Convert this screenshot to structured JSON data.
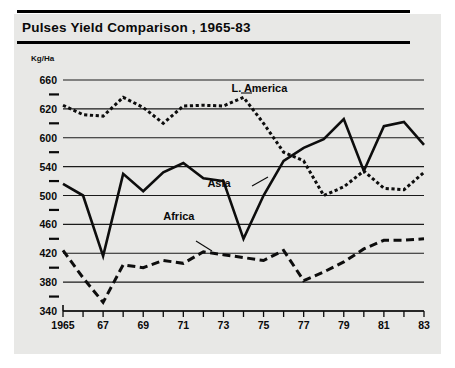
{
  "figure": {
    "title": "Pulses Yield Comparison , 1965-83",
    "unit_label": "Kg/Ha",
    "background_color": "#e8e8e6",
    "ink_color": "#0d0d0d"
  },
  "chart_data": {
    "type": "line",
    "title": "Pulses Yield Comparison , 1965-83",
    "xlabel": "",
    "ylabel": "Kg/Ha",
    "xlim": [
      1965,
      1983
    ],
    "ylim": [
      340,
      660
    ],
    "grid": true,
    "legend_position": "inline-annotations",
    "x": [
      1965,
      1966,
      1967,
      1968,
      1969,
      1970,
      1971,
      1972,
      1973,
      1974,
      1975,
      1976,
      1977,
      1978,
      1979,
      1980,
      1981,
      1982,
      1983
    ],
    "ytick_labels": [
      "660",
      "620",
      "600",
      "540",
      "500",
      "460",
      "420",
      "380",
      "340"
    ],
    "ytick_values": [
      660,
      620,
      580,
      540,
      500,
      460,
      420,
      380,
      340
    ],
    "minor_ytick_values": [
      640,
      600,
      560,
      520,
      480,
      440,
      400,
      360
    ],
    "xtick_labels": [
      "1965",
      "67",
      "69",
      "71",
      "73",
      "75",
      "77",
      "79",
      "81",
      "83"
    ],
    "xtick_values": [
      1965,
      1967,
      1969,
      1971,
      1973,
      1975,
      1977,
      1979,
      1981,
      1983
    ],
    "series": [
      {
        "name": "L. America",
        "style": "dotted",
        "label_x": 1973.4,
        "label_y": 643,
        "values": [
          625,
          612,
          610,
          636,
          622,
          600,
          624,
          625,
          624,
          636,
          600,
          560,
          548,
          500,
          512,
          534,
          510,
          508,
          532
        ]
      },
      {
        "name": "Asia",
        "style": "solid",
        "label_x": 1972.2,
        "label_y": 512,
        "values": [
          516,
          500,
          416,
          530,
          506,
          532,
          545,
          524,
          520,
          440,
          500,
          548,
          566,
          578,
          606,
          534,
          596,
          602,
          570
        ]
      },
      {
        "name": "Africa",
        "style": "dashed",
        "label_x": 1970.0,
        "label_y": 466,
        "values": [
          424,
          386,
          352,
          404,
          400,
          410,
          406,
          422,
          418,
          414,
          410,
          424,
          382,
          394,
          408,
          426,
          438,
          438,
          440
        ]
      }
    ]
  }
}
